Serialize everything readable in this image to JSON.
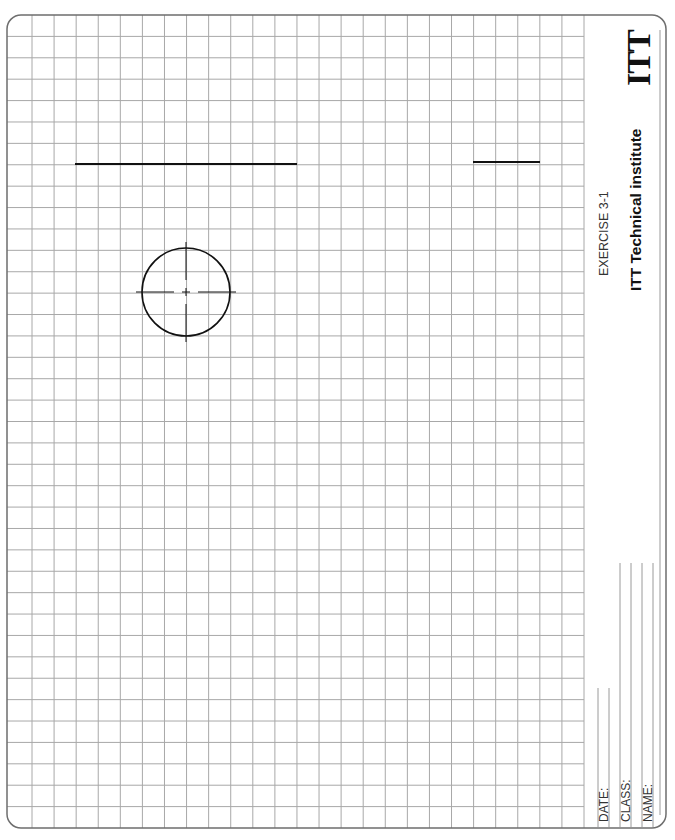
{
  "title_block": {
    "exercise": "EXERCISE 3-1",
    "institute": "ITT Technical institute",
    "logo": "ITT",
    "fields": [
      {
        "label": "DATE:"
      },
      {
        "label": "CLASS:"
      },
      {
        "label": "NAME:"
      }
    ]
  },
  "grid": {
    "columns": 26,
    "rows": 38,
    "line_color": "#a8a8a8",
    "border_color": "#777777"
  },
  "drawing": {
    "line_long": {
      "x1": 75,
      "y1": 164,
      "x2": 297,
      "y2": 164
    },
    "line_short": {
      "x1": 473,
      "y1": 162,
      "x2": 540,
      "y2": 162
    },
    "circle": {
      "cx": 186,
      "cy": 292,
      "r": 44
    }
  }
}
